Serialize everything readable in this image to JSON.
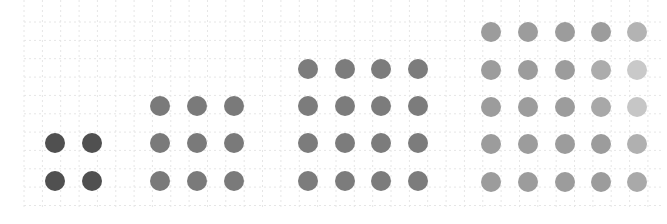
{
  "diagram": {
    "background": "#ffffff",
    "grid": {
      "color": "#e6e6e6",
      "cell": 18.35,
      "x_start": 24,
      "x_end": 662,
      "y_start": 22,
      "y_end": 210,
      "dashed": true
    },
    "dot_diameter": 20,
    "groups": [
      {
        "name": "2x2",
        "size": 2,
        "color": "#505050",
        "xs": [
          55,
          92
        ],
        "ys": [
          143,
          181
        ],
        "overrides": []
      },
      {
        "name": "3x3",
        "size": 3,
        "color": "#7a7a7a",
        "xs": [
          160,
          197,
          234
        ],
        "ys": [
          106,
          143,
          181
        ],
        "overrides": []
      },
      {
        "name": "4x4",
        "size": 4,
        "color": "#7c7c7c",
        "xs": [
          308,
          345,
          381,
          418
        ],
        "ys": [
          69,
          106,
          143,
          181
        ],
        "overrides": []
      },
      {
        "name": "5x5",
        "size": 5,
        "color": "#9c9c9c",
        "xs": [
          491,
          528,
          565,
          601,
          637
        ],
        "ys": [
          32,
          70,
          107,
          144,
          182
        ],
        "overrides": [
          {
            "row": 0,
            "col": 4,
            "color": "#b3b3b3"
          },
          {
            "row": 1,
            "col": 3,
            "color": "#acacac"
          },
          {
            "row": 1,
            "col": 4,
            "color": "#c9c9c9"
          },
          {
            "row": 2,
            "col": 3,
            "color": "#a8a8a8"
          },
          {
            "row": 2,
            "col": 4,
            "color": "#c6c6c6"
          },
          {
            "row": 3,
            "col": 4,
            "color": "#b0b0b0"
          },
          {
            "row": 4,
            "col": 4,
            "color": "#a9a9a9"
          }
        ]
      }
    ]
  }
}
